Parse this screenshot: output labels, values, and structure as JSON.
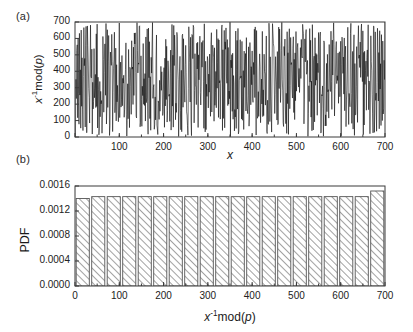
{
  "figure": {
    "width": 413,
    "height": 332,
    "background": "#ffffff",
    "line_color": "#000000",
    "frame_color": "#3a3a3a"
  },
  "panels": {
    "a": {
      "label": "(a)"
    },
    "b": {
      "label": "(b)"
    }
  },
  "chart_data": [
    {
      "type": "line",
      "panel": "(a)",
      "title": "",
      "xlabel": "x",
      "ylabel": "x⁻¹mod(p)",
      "ylabel_parts": {
        "base": "x",
        "exponent": "-1",
        "func": "mod(",
        "arg": "p",
        "close": ")"
      },
      "xlim": [
        0,
        700
      ],
      "ylim": [
        0,
        700
      ],
      "xticks": [
        0,
        100,
        200,
        300,
        400,
        500,
        600,
        700
      ],
      "xtick_labels": [
        "",
        "100",
        "200",
        "300",
        "400",
        "500",
        "600",
        "700"
      ],
      "yticks": [
        0,
        100,
        200,
        300,
        400,
        500,
        600,
        700
      ],
      "ytick_labels": [
        "0",
        "100",
        "200",
        "300",
        "400",
        "500",
        "600",
        "700"
      ],
      "grid": false,
      "legend": null,
      "description": "Dense pseudo-random scatter/line of modular inverse values spanning the full range 0-700 for x from 1 to 700",
      "x": [
        1,
        2,
        3,
        4,
        5,
        6,
        7,
        8,
        9,
        10
      ],
      "y": [
        1,
        352,
        235,
        176,
        141,
        352,
        604,
        88,
        235,
        633
      ],
      "n_points": 700
    },
    {
      "type": "bar",
      "panel": "(b)",
      "title": "",
      "xlabel": "x⁻¹mod(p)",
      "xlabel_parts": {
        "base": "x",
        "exponent": "-1",
        "func": "mod(",
        "arg": "p",
        "close": ")"
      },
      "ylabel": "PDF",
      "xlim": [
        0,
        700
      ],
      "ylim": [
        0.0,
        0.0016
      ],
      "xticks": [
        0,
        100,
        200,
        300,
        400,
        500,
        600,
        700
      ],
      "xtick_labels": [
        "0",
        "100",
        "200",
        "300",
        "400",
        "500",
        "600",
        "700"
      ],
      "yticks": [
        0.0,
        0.0004,
        0.0008,
        0.0012,
        0.0016
      ],
      "ytick_labels": [
        "0.0000",
        "0.0004",
        "0.0008",
        "0.0012",
        "0.0016"
      ],
      "grid": false,
      "legend": null,
      "bar_fill": "hatch-diagonal-45",
      "bar_edge_color": "#555555",
      "n_bins": 20,
      "bin_width": 35,
      "bin_centers": [
        17.5,
        52.5,
        87.5,
        122.5,
        157.5,
        192.5,
        227.5,
        262.5,
        297.5,
        332.5,
        367.5,
        402.5,
        437.5,
        472.5,
        507.5,
        542.5,
        577.5,
        612.5,
        647.5,
        682.5
      ],
      "values": [
        0.0014,
        0.00143,
        0.00143,
        0.00143,
        0.00143,
        0.00143,
        0.00143,
        0.00143,
        0.00143,
        0.00143,
        0.00143,
        0.00143,
        0.00143,
        0.00143,
        0.00143,
        0.00143,
        0.00143,
        0.00143,
        0.00143,
        0.00152
      ],
      "description": "Nearly flat uniform probability density of the modular inverse distribution"
    }
  ]
}
